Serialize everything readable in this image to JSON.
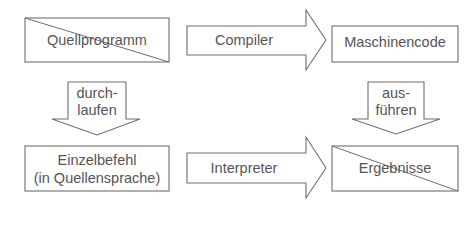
{
  "diagram": {
    "nodes": {
      "source_program": {
        "label": "Quellprogramm"
      },
      "machine_code": {
        "label": "Maschinencode"
      },
      "single_instruction": {
        "line1": "Einzelbefehl",
        "line2": "(in Quellensprache)"
      },
      "results": {
        "label": "Ergebnisse"
      }
    },
    "arrows": {
      "compiler": {
        "label": "Compiler"
      },
      "interpreter": {
        "label": "Interpreter"
      },
      "run_through": {
        "line1": "durch-",
        "line2": "laufen"
      },
      "execute": {
        "line1": "aus-",
        "line2": "führen"
      }
    },
    "colors": {
      "stroke": "#6e6e6e",
      "text": "#555555",
      "background": "#ffffff"
    }
  }
}
